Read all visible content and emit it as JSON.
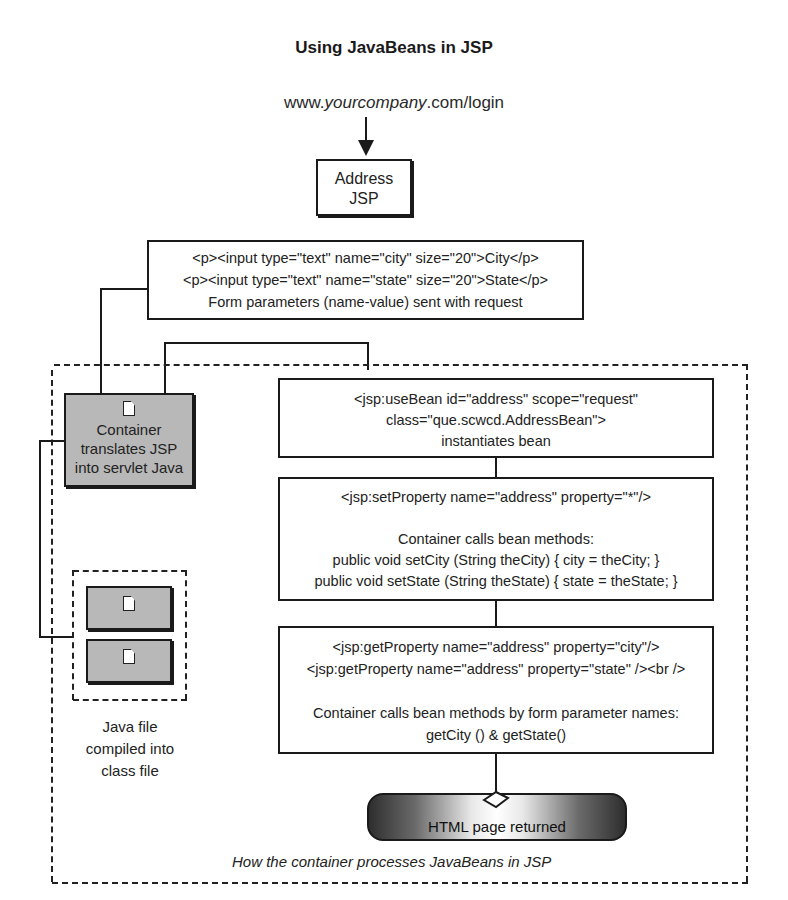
{
  "title": "Using JavaBeans in JSP",
  "url": {
    "prefix": "www.",
    "domain": "yourcompany",
    "suffix": ".com/login"
  },
  "address_jsp": {
    "line1": "Address",
    "line2": "JSP"
  },
  "form_box": {
    "line1": "<p><input type=\"text\" name=\"city\" size=\"20\">City</p>",
    "line2": "<p><input type=\"text\" name=\"state\" size=\"20\">State</p>",
    "line3": "Form parameters (name-value) sent with request"
  },
  "container_box": {
    "line1": "Container",
    "line2": "translates JSP",
    "line3": "into servlet Java"
  },
  "java_files": {
    "caption1": "Java file",
    "caption2": "compiled into",
    "caption3": "class file"
  },
  "usebean_box": {
    "line1": "<jsp:useBean id=\"address\" scope=\"request\"",
    "line2": "class=\"que.scwcd.AddressBean\">",
    "line3": "instantiates bean"
  },
  "setproperty_box": {
    "line1": "<jsp:setProperty name=\"address\" property=\"*\"/>",
    "line2": "Container calls bean methods:",
    "line3": "public void setCity (String theCity) { city = theCity; }",
    "line4": "public void setState (String theState) { state = theState; }"
  },
  "getproperty_box": {
    "line1": "<jsp:getProperty name=\"address\" property=\"city\"/>",
    "line2": "<jsp:getProperty name=\"address\" property=\"state\" /><br />",
    "line3": "Container calls bean methods by form parameter names:",
    "line4": "getCity () & getState()"
  },
  "result": {
    "label": "HTML page returned"
  },
  "container_caption": "How the container processes JavaBeans in JSP"
}
